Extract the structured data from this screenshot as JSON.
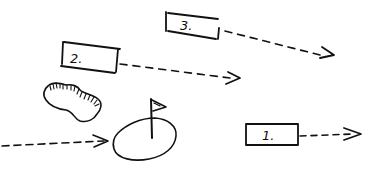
{
  "diagram": {
    "style": "hand-drawn sketch",
    "ink_color": "#111111",
    "background": "#ffffff",
    "boxes": [
      {
        "id": "box-1",
        "label": "1."
      },
      {
        "id": "box-2",
        "label": "2."
      },
      {
        "id": "box-3",
        "label": "3."
      }
    ],
    "elements": {
      "green": "putting-green",
      "flag": "flag-pin",
      "bunker": "sand-bunker",
      "approach_arrow": "dashed-arrow-to-green"
    }
  }
}
